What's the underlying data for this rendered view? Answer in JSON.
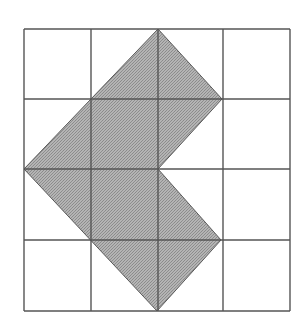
{
  "figure": {
    "type": "grid-shaded-polygon",
    "grid": {
      "columns": 4,
      "rows": 4,
      "x_lines": [
        24,
        91,
        158,
        223,
        290
      ],
      "y_lines": [
        29,
        99,
        169,
        240,
        311
      ],
      "line_color": "#555555",
      "line_width": 1.4
    },
    "shape": {
      "name": "chevron-arrow",
      "fill_color": "#a8a8a8",
      "stroke_color": "#5a5a5a",
      "vertices_grid_units": [
        [
          2,
          0
        ],
        [
          3,
          1
        ],
        [
          2,
          2
        ],
        [
          3,
          3
        ],
        [
          2,
          4
        ],
        [
          0,
          2
        ]
      ],
      "vertices_px": [
        [
          158,
          29
        ],
        [
          222,
          99
        ],
        [
          158,
          169
        ],
        [
          221,
          240
        ],
        [
          157,
          311
        ],
        [
          24,
          169
        ]
      ]
    },
    "colors": {
      "background": "#ffffff",
      "fill": "#a8a8a8",
      "grid": "#555555"
    }
  }
}
